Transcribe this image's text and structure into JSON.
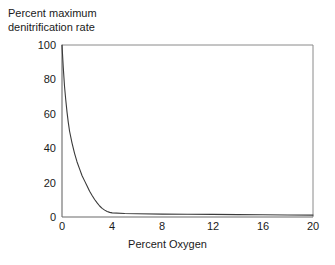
{
  "chart_data": {
    "type": "line",
    "title": "",
    "xlabel": "Percent Oxygen",
    "ylabel": "Percent maximum denitrification rate",
    "ylabel_lines": [
      "Percent maximum",
      "denitrification rate"
    ],
    "xlim": [
      0,
      20
    ],
    "ylim": [
      0,
      100
    ],
    "xticks": [
      0,
      4,
      8,
      12,
      16,
      20
    ],
    "xtick_labels": [
      "0",
      "4",
      "8",
      "12",
      "16",
      "20"
    ],
    "yticks": [
      0,
      20,
      40,
      60,
      80,
      100
    ],
    "ytick_labels": [
      "0",
      "20",
      "40",
      "60",
      "80",
      "100"
    ],
    "grid": false,
    "legend": false,
    "line_color": "#3a3a3a",
    "frame_color": "#8a8a8a",
    "background": "#ffffff",
    "series": [
      {
        "name": "Denitrification rate",
        "x": [
          0.0,
          0.1,
          0.2,
          0.3,
          0.4,
          0.5,
          0.6,
          0.8,
          1.0,
          1.2,
          1.4,
          1.6,
          1.8,
          2.0,
          2.2,
          2.4,
          2.6,
          2.8,
          3.0,
          3.2,
          3.4,
          3.6,
          3.8,
          4.0,
          5.0,
          6.0,
          8.0,
          10.0,
          12.0,
          14.0,
          16.0,
          18.0,
          20.0
        ],
        "values": [
          100,
          87,
          76,
          68,
          61,
          55,
          50,
          43,
          37,
          32,
          28,
          24,
          21,
          18,
          15,
          12.5,
          10.2,
          8.2,
          6.4,
          5.0,
          4.0,
          3.2,
          2.7,
          2.4,
          2.0,
          1.9,
          1.7,
          1.6,
          1.5,
          1.4,
          1.3,
          1.2,
          1.1
        ]
      }
    ],
    "annotations": []
  }
}
